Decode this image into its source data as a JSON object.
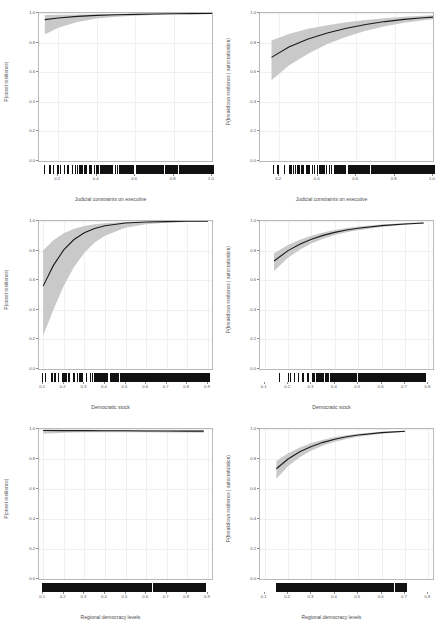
{
  "figure": {
    "layout": "2 columns x 3 rows of marginal-effect panels",
    "background_color": "#ffffff",
    "ribbon_color": "#c9c9c9",
    "line_color": "#1a1a1a",
    "panel_border_color": "#b9b9b9",
    "grid_color": "#f0f0f0",
    "rug_color": "#111111"
  },
  "chart_data": [
    {
      "id": "panel-1",
      "type": "line",
      "title": "",
      "xlabel": "Judicial constraints on executive",
      "ylabel": "P(onset resilience)",
      "xlim": [
        0.1,
        1.0
      ],
      "ylim": [
        0.0,
        1.0
      ],
      "xticks": [
        "0.2",
        "0.4",
        "0.6",
        "0.8",
        "1.0"
      ],
      "xtick_values": [
        0.2,
        0.4,
        0.6,
        0.8,
        1.0
      ],
      "yticks": [
        "0.0",
        "0.2",
        "0.4",
        "0.6",
        "0.8",
        "1.0"
      ],
      "ytick_values": [
        0.0,
        0.2,
        0.4,
        0.6,
        0.8,
        1.0
      ],
      "grid": true,
      "legend": "none",
      "series": [
        {
          "name": "fit",
          "x": [
            0.13,
            0.2,
            0.3,
            0.4,
            0.5,
            0.6,
            0.7,
            0.8,
            0.9,
            1.0
          ],
          "values": [
            0.955,
            0.966,
            0.977,
            0.984,
            0.988,
            0.991,
            0.993,
            0.995,
            0.996,
            0.997
          ]
        },
        {
          "name": "ci_upper",
          "x": [
            0.13,
            0.2,
            0.3,
            0.4,
            0.5,
            0.6,
            0.7,
            0.8,
            0.9,
            1.0
          ],
          "values": [
            0.986,
            0.988,
            0.99,
            0.992,
            0.993,
            0.995,
            0.996,
            0.997,
            0.998,
            0.999
          ]
        },
        {
          "name": "ci_lower",
          "x": [
            0.13,
            0.2,
            0.3,
            0.4,
            0.5,
            0.6,
            0.7,
            0.8,
            0.9,
            1.0
          ],
          "values": [
            0.855,
            0.9,
            0.94,
            0.962,
            0.974,
            0.982,
            0.987,
            0.991,
            0.993,
            0.995
          ]
        }
      ],
      "rug_density": "sparse at left, dense from 0.35 to 1.0"
    },
    {
      "id": "panel-2",
      "type": "line",
      "title": "",
      "xlabel": "Judicial constraints on executive",
      "ylabel": "P(breakdown resilience | autocratization)",
      "xlim": [
        0.1,
        1.0
      ],
      "ylim": [
        0.0,
        1.0
      ],
      "xticks": [
        "0.2",
        "0.4",
        "0.6",
        "0.8",
        "1.0"
      ],
      "xtick_values": [
        0.2,
        0.4,
        0.6,
        0.8,
        1.0
      ],
      "yticks": [
        "0.0",
        "0.2",
        "0.4",
        "0.6",
        "0.8",
        "1.0"
      ],
      "ytick_values": [
        0.0,
        0.2,
        0.4,
        0.6,
        0.8,
        1.0
      ],
      "grid": true,
      "legend": "none",
      "series": [
        {
          "name": "fit",
          "x": [
            0.16,
            0.25,
            0.35,
            0.45,
            0.55,
            0.65,
            0.75,
            0.85,
            0.95,
            1.0
          ],
          "values": [
            0.7,
            0.77,
            0.825,
            0.865,
            0.897,
            0.922,
            0.942,
            0.957,
            0.968,
            0.972
          ]
        },
        {
          "name": "ci_upper",
          "x": [
            0.16,
            0.25,
            0.35,
            0.45,
            0.55,
            0.65,
            0.75,
            0.85,
            0.95,
            1.0
          ],
          "values": [
            0.815,
            0.858,
            0.893,
            0.918,
            0.938,
            0.953,
            0.965,
            0.974,
            0.981,
            0.984
          ]
        },
        {
          "name": "ci_lower",
          "x": [
            0.16,
            0.25,
            0.35,
            0.45,
            0.55,
            0.65,
            0.75,
            0.85,
            0.95,
            1.0
          ],
          "values": [
            0.545,
            0.645,
            0.725,
            0.79,
            0.84,
            0.88,
            0.91,
            0.934,
            0.951,
            0.958
          ]
        }
      ],
      "rug_density": "sparse at left, very dense from 0.4 to 1.0"
    },
    {
      "id": "panel-3",
      "type": "line",
      "title": "",
      "xlabel": "Democratic stock",
      "ylabel": "P(onset resilience)",
      "xlim": [
        0.08,
        0.92
      ],
      "ylim": [
        0.0,
        1.0
      ],
      "xticks": [
        "0.1",
        "0.2",
        "0.3",
        "0.4",
        "0.5",
        "0.6",
        "0.7",
        "0.8",
        "0.9"
      ],
      "xtick_values": [
        0.1,
        0.2,
        0.3,
        0.4,
        0.5,
        0.6,
        0.7,
        0.8,
        0.9
      ],
      "yticks": [
        "0.0",
        "0.2",
        "0.4",
        "0.6",
        "0.8",
        "1.0"
      ],
      "ytick_values": [
        0.0,
        0.2,
        0.4,
        0.6,
        0.8,
        1.0
      ],
      "grid": true,
      "legend": "none",
      "series": [
        {
          "name": "fit",
          "x": [
            0.1,
            0.15,
            0.2,
            0.25,
            0.3,
            0.35,
            0.4,
            0.5,
            0.6,
            0.7,
            0.8,
            0.9
          ],
          "values": [
            0.56,
            0.7,
            0.805,
            0.875,
            0.92,
            0.95,
            0.968,
            0.986,
            0.993,
            0.996,
            0.998,
            0.999
          ]
        },
        {
          "name": "ci_upper",
          "x": [
            0.1,
            0.15,
            0.2,
            0.25,
            0.3,
            0.35,
            0.4,
            0.5,
            0.6,
            0.7,
            0.8,
            0.9
          ],
          "values": [
            0.8,
            0.87,
            0.918,
            0.948,
            0.966,
            0.978,
            0.985,
            0.993,
            0.996,
            0.998,
            0.999,
            0.999
          ]
        },
        {
          "name": "ci_lower",
          "x": [
            0.1,
            0.15,
            0.2,
            0.25,
            0.3,
            0.35,
            0.4,
            0.5,
            0.6,
            0.7,
            0.8,
            0.9
          ],
          "values": [
            0.225,
            0.4,
            0.56,
            0.69,
            0.785,
            0.855,
            0.9,
            0.955,
            0.978,
            0.989,
            0.994,
            0.997
          ]
        }
      ],
      "rug_density": "moderate below 0.3, dense from 0.3 to 0.9"
    },
    {
      "id": "panel-4",
      "type": "line",
      "title": "",
      "xlabel": "Democratic stock",
      "ylabel": "P(breakdown resilience | autocratization)",
      "xlim": [
        0.08,
        0.82
      ],
      "ylim": [
        0.0,
        1.0
      ],
      "xticks": [
        "0.1",
        "0.2",
        "0.3",
        "0.4",
        "0.5",
        "0.6",
        "0.7",
        "0.8"
      ],
      "xtick_values": [
        0.1,
        0.2,
        0.3,
        0.4,
        0.5,
        0.6,
        0.7,
        0.8
      ],
      "yticks": [
        "0.0",
        "0.2",
        "0.4",
        "0.6",
        "0.8",
        "1.0"
      ],
      "ytick_values": [
        0.0,
        0.2,
        0.4,
        0.6,
        0.8,
        1.0
      ],
      "grid": true,
      "legend": "none",
      "series": [
        {
          "name": "fit",
          "x": [
            0.14,
            0.2,
            0.25,
            0.3,
            0.35,
            0.4,
            0.45,
            0.5,
            0.6,
            0.7,
            0.78
          ],
          "values": [
            0.73,
            0.8,
            0.843,
            0.877,
            0.903,
            0.923,
            0.939,
            0.951,
            0.969,
            0.98,
            0.986
          ]
        },
        {
          "name": "ci_upper",
          "x": [
            0.14,
            0.2,
            0.25,
            0.3,
            0.35,
            0.4,
            0.45,
            0.5,
            0.6,
            0.7,
            0.78
          ],
          "values": [
            0.782,
            0.838,
            0.873,
            0.901,
            0.923,
            0.94,
            0.953,
            0.963,
            0.977,
            0.986,
            0.991
          ]
        },
        {
          "name": "ci_lower",
          "x": [
            0.14,
            0.2,
            0.25,
            0.3,
            0.35,
            0.4,
            0.45,
            0.5,
            0.6,
            0.7,
            0.78
          ],
          "values": [
            0.662,
            0.752,
            0.806,
            0.848,
            0.88,
            0.905,
            0.924,
            0.938,
            0.96,
            0.974,
            0.981
          ]
        }
      ],
      "rug_density": "light below 0.25, dense from 0.25 to 0.8"
    },
    {
      "id": "panel-5",
      "type": "line",
      "title": "",
      "xlabel": "Regional democracy levels",
      "ylabel": "P(onset resilience)",
      "xlim": [
        0.08,
        0.92
      ],
      "ylim": [
        0.0,
        1.0
      ],
      "xticks": [
        "0.1",
        "0.2",
        "0.3",
        "0.4",
        "0.5",
        "0.6",
        "0.7",
        "0.8",
        "0.9"
      ],
      "xtick_values": [
        0.1,
        0.2,
        0.3,
        0.4,
        0.5,
        0.6,
        0.7,
        0.8,
        0.9
      ],
      "yticks": [
        "0.0",
        "0.2",
        "0.4",
        "0.6",
        "0.8",
        "1.0"
      ],
      "ytick_values": [
        0.0,
        0.2,
        0.4,
        0.6,
        0.8,
        1.0
      ],
      "grid": true,
      "legend": "none",
      "series": [
        {
          "name": "fit",
          "x": [
            0.1,
            0.2,
            0.3,
            0.4,
            0.5,
            0.6,
            0.7,
            0.8,
            0.88
          ],
          "values": [
            0.99,
            0.989,
            0.989,
            0.988,
            0.988,
            0.987,
            0.987,
            0.986,
            0.986
          ]
        },
        {
          "name": "ci_upper",
          "x": [
            0.1,
            0.2,
            0.3,
            0.4,
            0.5,
            0.6,
            0.7,
            0.8,
            0.88
          ],
          "values": [
            0.996,
            0.995,
            0.994,
            0.994,
            0.993,
            0.993,
            0.992,
            0.992,
            0.992
          ]
        },
        {
          "name": "ci_lower",
          "x": [
            0.1,
            0.2,
            0.3,
            0.4,
            0.5,
            0.6,
            0.7,
            0.8,
            0.88
          ],
          "values": [
            0.968,
            0.975,
            0.978,
            0.979,
            0.979,
            0.978,
            0.977,
            0.976,
            0.975
          ]
        }
      ],
      "rug_density": "dense and even across full range"
    },
    {
      "id": "panel-6",
      "type": "line",
      "title": "",
      "xlabel": "Regional democracy levels",
      "ylabel": "P(breakdown resilience | autocratization)",
      "xlim": [
        0.08,
        0.82
      ],
      "ylim": [
        0.0,
        1.0
      ],
      "xticks": [
        "0.1",
        "0.2",
        "0.3",
        "0.4",
        "0.5",
        "0.6",
        "0.7",
        "0.8"
      ],
      "xtick_values": [
        0.1,
        0.2,
        0.3,
        0.4,
        0.5,
        0.6,
        0.7,
        0.8
      ],
      "yticks": [
        "0.0",
        "0.2",
        "0.4",
        "0.6",
        "0.8",
        "1.0"
      ],
      "ytick_values": [
        0.0,
        0.2,
        0.4,
        0.6,
        0.8,
        1.0
      ],
      "grid": true,
      "legend": "none",
      "series": [
        {
          "name": "fit",
          "x": [
            0.15,
            0.2,
            0.25,
            0.3,
            0.35,
            0.4,
            0.45,
            0.5,
            0.6,
            0.7
          ],
          "values": [
            0.735,
            0.8,
            0.848,
            0.884,
            0.911,
            0.932,
            0.948,
            0.96,
            0.976,
            0.985
          ]
        },
        {
          "name": "ci_upper",
          "x": [
            0.15,
            0.2,
            0.25,
            0.3,
            0.35,
            0.4,
            0.45,
            0.5,
            0.6,
            0.7
          ],
          "values": [
            0.786,
            0.838,
            0.877,
            0.906,
            0.929,
            0.946,
            0.959,
            0.969,
            0.982,
            0.989
          ]
        },
        {
          "name": "ci_lower",
          "x": [
            0.15,
            0.2,
            0.25,
            0.3,
            0.35,
            0.4,
            0.45,
            0.5,
            0.6,
            0.7
          ],
          "values": [
            0.668,
            0.752,
            0.812,
            0.857,
            0.89,
            0.915,
            0.934,
            0.949,
            0.969,
            0.98
          ]
        }
      ],
      "rug_density": "dense across full range with gaps near right edge"
    }
  ]
}
